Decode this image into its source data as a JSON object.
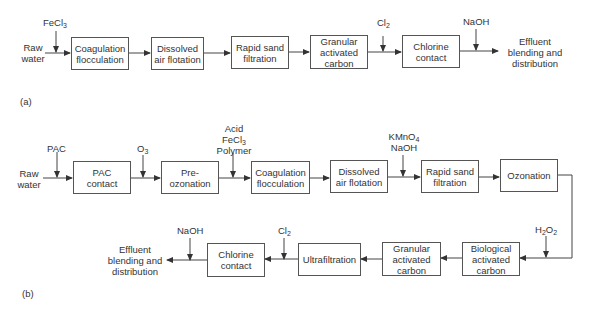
{
  "diagram_a": {
    "label": "(a)",
    "input": [
      "Raw",
      "water"
    ],
    "output": [
      "Effluent",
      "blending and",
      "distribution"
    ],
    "steps": [
      {
        "lines": [
          "Coagulation",
          "flocculation"
        ]
      },
      {
        "lines": [
          "Dissolved",
          "air flotation"
        ]
      },
      {
        "lines": [
          "Rapid sand",
          "filtration"
        ]
      },
      {
        "lines": [
          "Granular",
          "activated",
          "carbon"
        ]
      },
      {
        "lines": [
          "Chlorine",
          "contact"
        ]
      }
    ],
    "chemicals": [
      {
        "before_step": 1,
        "name": "FeCl",
        "sub": "3"
      },
      {
        "before_step": 5,
        "name": "Cl",
        "sub": "2"
      },
      {
        "after_step": 5,
        "name": "NaOH",
        "sub": ""
      }
    ]
  },
  "diagram_b": {
    "label": "(b)",
    "input": [
      "Raw",
      "water"
    ],
    "output": [
      "Effluent",
      "blending and",
      "distribution"
    ],
    "steps": [
      {
        "lines": [
          "PAC",
          "contact"
        ]
      },
      {
        "lines": [
          "Pre-",
          "ozonation"
        ]
      },
      {
        "lines": [
          "Coagulation",
          "flocculation"
        ]
      },
      {
        "lines": [
          "Dissolved",
          "air flotation"
        ]
      },
      {
        "lines": [
          "Rapid sand",
          "filtration"
        ]
      },
      {
        "lines": [
          "Ozonation"
        ]
      },
      {
        "lines": [
          "Biological",
          "activated",
          "carbon"
        ]
      },
      {
        "lines": [
          "Granular",
          "activated",
          "carbon"
        ]
      },
      {
        "lines": [
          "Ultrafiltration"
        ]
      },
      {
        "lines": [
          "Chlorine",
          "contact"
        ]
      }
    ],
    "chemicals": [
      {
        "before_step": 1,
        "name": "PAC",
        "sub": ""
      },
      {
        "before_step": 2,
        "name": "O",
        "sub": "3"
      },
      {
        "before_step": 3,
        "lines": [
          "Acid",
          "FeCl3",
          "Polymer"
        ],
        "line2_name": "FeCl",
        "line2_sub": "3"
      },
      {
        "before_step": 5,
        "lines": [
          "KMnO4",
          "NaOH"
        ],
        "line1_name": "KMnO",
        "line1_sub": "4"
      },
      {
        "before_step": 7,
        "name": "H",
        "sub": "2",
        "name2": "O",
        "sub2": "2"
      },
      {
        "before_step": 10,
        "name": "Cl",
        "sub": "2"
      },
      {
        "after_step": 10,
        "name": "NaOH",
        "sub": ""
      }
    ]
  }
}
